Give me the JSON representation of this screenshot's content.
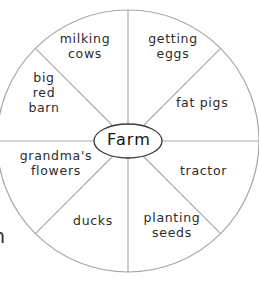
{
  "diagram": {
    "type": "word-web-wheel",
    "hub_label": "Farm",
    "segment_count": 8,
    "colors": {
      "wheel_stroke": "#a8a8a8",
      "hub_stroke": "#3a3a3a",
      "text": "#2b2b2b",
      "background": "#ffffff"
    },
    "geometry": {
      "center_x": 128,
      "center_y": 141,
      "radius": 131,
      "hub_rx": 34,
      "hub_ry": 17
    },
    "segments": [
      {
        "id": "milking-cows",
        "label": "milking\ncows"
      },
      {
        "id": "getting-eggs",
        "label": "getting\neggs"
      },
      {
        "id": "big-red-barn",
        "label": "big\nred\nbarn"
      },
      {
        "id": "fat-pigs",
        "label": "fat pigs"
      },
      {
        "id": "grandmas-flowers",
        "label": "grandma's\nflowers"
      },
      {
        "id": "tractor",
        "label": "tractor"
      },
      {
        "id": "ducks",
        "label": "ducks"
      },
      {
        "id": "planting-seeds",
        "label": "planting\nseeds"
      }
    ],
    "edge_fragment": "n"
  }
}
